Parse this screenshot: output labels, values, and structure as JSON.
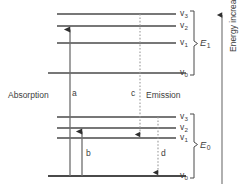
{
  "diagram": {
    "type": "energy-level-diagram",
    "background_color": "#ffffff",
    "line_color": "#4a4a4a",
    "text_color": "#3d3d3d",
    "dotted_line_color": "#8c8c8c",
    "axis": {
      "label": "Energy increasing",
      "direction": "up"
    },
    "manifolds": [
      {
        "id": "excited",
        "bracket_label": "E",
        "bracket_sub": "1",
        "levels": [
          {
            "label": "v",
            "sub": "3",
            "y": 14
          },
          {
            "label": "v",
            "sub": "2",
            "y": 26
          },
          {
            "label": "v",
            "sub": "1",
            "y": 43
          },
          {
            "label": "v",
            "sub": "0",
            "y": 73
          }
        ]
      },
      {
        "id": "ground",
        "bracket_label": "E",
        "bracket_sub": "0",
        "levels": [
          {
            "label": "v",
            "sub": "3",
            "y": 117
          },
          {
            "label": "v",
            "sub": "2",
            "y": 128
          },
          {
            "label": "v",
            "sub": "1",
            "y": 138
          },
          {
            "label": "v",
            "sub": "0",
            "y": 176
          }
        ]
      }
    ],
    "processes": [
      {
        "name": "absorption",
        "label": "Absorption"
      },
      {
        "name": "emission",
        "label": "Emission"
      }
    ],
    "transitions": [
      {
        "id": "a",
        "label": "a",
        "style": "solid",
        "direction": "up",
        "from_y": 176,
        "to_y": 26,
        "x": 70,
        "label_x": 72,
        "label_y": 92
      },
      {
        "id": "b",
        "label": "b",
        "style": "solid",
        "direction": "up",
        "from_y": 176,
        "to_y": 128,
        "x": 82,
        "label_x": 86,
        "label_y": 152
      },
      {
        "id": "c",
        "label": "c",
        "style": "dotted",
        "direction": "down",
        "from_y": 14,
        "to_y": 138,
        "x": 140,
        "label_x": 131,
        "label_y": 92
      },
      {
        "id": "d",
        "label": "d",
        "style": "dotted",
        "direction": "down",
        "from_y": 117,
        "to_y": 176,
        "x": 158,
        "label_x": 161,
        "label_y": 152
      }
    ]
  }
}
